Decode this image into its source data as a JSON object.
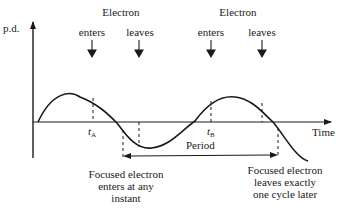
{
  "diagram": {
    "axes": {
      "y_label": "p.d.",
      "x_label": "Time"
    },
    "top_labels": [
      {
        "heading": "Electron",
        "enters": "enters",
        "leaves": "leaves"
      },
      {
        "heading": "Electron",
        "enters": "enters",
        "leaves": "leaves"
      }
    ],
    "time_marks": [
      {
        "symbol": "t",
        "subscript": "A"
      },
      {
        "symbol": "t",
        "subscript": "B"
      }
    ],
    "period_label": "Period",
    "captions": {
      "left": [
        "Focused electron",
        "enters at any",
        "instant"
      ],
      "right": [
        "Focused electron",
        "leaves exactly",
        "one cycle later"
      ]
    },
    "colors": {
      "line": "#1a1a1a",
      "background": "#ffffff"
    }
  }
}
